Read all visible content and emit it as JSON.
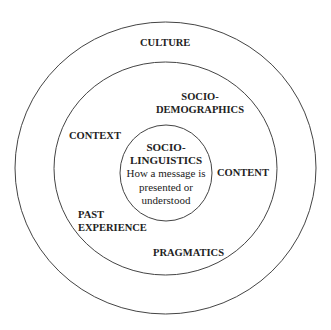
{
  "diagram": {
    "type": "concentric-circles",
    "rings": [
      {
        "id": "outer",
        "label": "CULTURE"
      },
      {
        "id": "middle",
        "labels": [
          "SOCIO-DEMOGRAPHICS",
          "CONTEXT",
          "CONTENT",
          "PAST EXPERIENCE",
          "PRAGMATICS"
        ]
      },
      {
        "id": "inner",
        "label": "SOCIO-LINGUISTICS",
        "description": "How a message is presented or understood"
      }
    ]
  },
  "labels": {
    "culture": "CULTURE",
    "sociodemographics_1": "SOCIO-",
    "sociodemographics_2": "DEMOGRAPHICS",
    "context": "CONTEXT",
    "content": "CONTENT",
    "past_experience_1": "PAST",
    "past_experience_2": "EXPERIENCE",
    "pragmatics": "PRAGMATICS",
    "sociolinguistics_1": "SOCIO-",
    "sociolinguistics_2": "LINGUISTICS",
    "description_1": "How a message is",
    "description_2": "presented or",
    "description_3": "understood"
  },
  "colors": {
    "stroke": "#444444",
    "text": "#222222",
    "background": "#ffffff"
  }
}
